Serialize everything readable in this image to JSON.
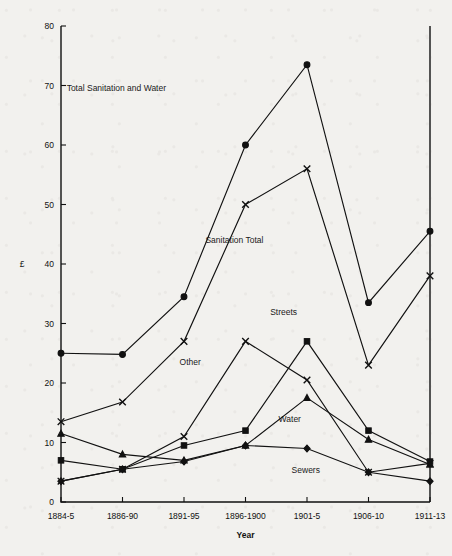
{
  "chart_data": {
    "type": "line",
    "title": "",
    "xlabel": "Year",
    "ylabel": "£",
    "categories": [
      "1884-5",
      "1886-90",
      "1891-95",
      "1896-1900",
      "1901-5",
      "1906-10",
      "1911-13"
    ],
    "ylim": [
      0,
      80
    ],
    "yticks": [
      0,
      10,
      20,
      30,
      40,
      50,
      60,
      70,
      80
    ],
    "grid": false,
    "legend": "inline-annotations",
    "series": [
      {
        "name": "Total Sanitation and Water",
        "marker": "circle",
        "values": [
          25,
          24.8,
          34.5,
          60,
          73.5,
          33.5,
          45.5
        ]
      },
      {
        "name": "Sanitation Total",
        "marker": "cross",
        "values": [
          13.5,
          16.8,
          27,
          50,
          56,
          23,
          38
        ]
      },
      {
        "name": "Streets",
        "marker": "square",
        "values": [
          7,
          5.5,
          9.5,
          12,
          27,
          12,
          6.8
        ]
      },
      {
        "name": "Other",
        "marker": "cross",
        "values": [
          3.5,
          5.5,
          11,
          27,
          20.5,
          5,
          6.5
        ]
      },
      {
        "name": "Water",
        "marker": "triangle",
        "values": [
          11.5,
          8,
          7,
          9.5,
          17.5,
          10.5,
          6.3
        ]
      },
      {
        "name": "Sewers",
        "marker": "diamond",
        "values": [
          3.5,
          5.5,
          6.8,
          9.5,
          9,
          5,
          3.5
        ]
      }
    ],
    "annotations": [
      {
        "text": "Total Sanitation and Water",
        "x": 0.9,
        "y": 69
      },
      {
        "text": "Sanitation Total",
        "x": 2.82,
        "y": 43.5
      },
      {
        "text": "Streets",
        "x": 3.62,
        "y": 31.5
      },
      {
        "text": "Other",
        "x": 2.1,
        "y": 23.0
      },
      {
        "text": "Water",
        "x": 3.72,
        "y": 13.4
      },
      {
        "text": "Sewers",
        "x": 3.98,
        "y": 4.9
      }
    ]
  }
}
